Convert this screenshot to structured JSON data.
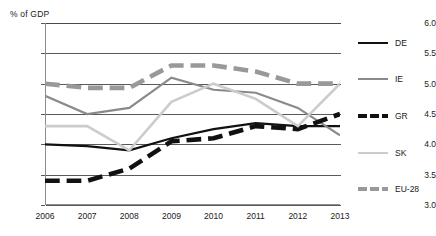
{
  "chart_data": {
    "type": "line",
    "title": "",
    "subtitle": "",
    "ylabel": "% of GDP",
    "xlabel": "",
    "ylim": [
      3.0,
      6.0
    ],
    "ytick_step": 0.5,
    "grid": true,
    "legend_position": "right",
    "categories": [
      "2006",
      "2007",
      "2008",
      "2009",
      "2010",
      "2011",
      "2012",
      "2013"
    ],
    "x": [
      2006,
      2007,
      2008,
      2009,
      2010,
      2011,
      2012,
      2013
    ],
    "yticks": [
      "6.0",
      "5.5",
      "5.0",
      "4.5",
      "4.0",
      "3.5",
      "3.0"
    ],
    "series": [
      {
        "name": "DE",
        "color": "#111111",
        "width": 2.2,
        "dash": "none",
        "values": [
          4.0,
          3.97,
          3.9,
          4.1,
          4.25,
          4.35,
          4.3,
          4.3
        ]
      },
      {
        "name": "IE",
        "color": "#8a8a8a",
        "width": 2.2,
        "dash": "none",
        "values": [
          4.8,
          4.5,
          4.6,
          5.1,
          4.9,
          4.85,
          4.6,
          4.15
        ]
      },
      {
        "name": "GR",
        "color": "#111111",
        "width": 4.6,
        "dash": "dashed",
        "values": [
          3.4,
          3.4,
          3.6,
          4.05,
          4.1,
          4.3,
          4.25,
          4.5
        ]
      },
      {
        "name": "SK",
        "color": "#cccccc",
        "width": 2.6,
        "dash": "none",
        "values": [
          4.3,
          4.3,
          3.9,
          4.7,
          5.0,
          4.75,
          4.3,
          5.0
        ]
      },
      {
        "name": "EU-28",
        "color": "#999999",
        "width": 4.6,
        "dash": "dashed",
        "values": [
          5.0,
          4.93,
          4.93,
          5.3,
          5.3,
          5.2,
          5.0,
          5.0
        ]
      }
    ]
  },
  "legend": {
    "items": [
      {
        "label": "DE"
      },
      {
        "label": "IE"
      },
      {
        "label": "GR"
      },
      {
        "label": "SK"
      },
      {
        "label": "EU-28"
      }
    ]
  }
}
